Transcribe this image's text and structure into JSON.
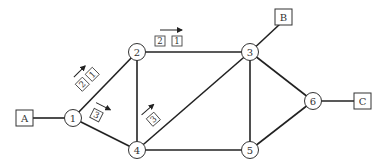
{
  "diagram": {
    "type": "network-graph",
    "routers": [
      {
        "id": "1",
        "label": "1"
      },
      {
        "id": "2",
        "label": "2"
      },
      {
        "id": "3",
        "label": "3"
      },
      {
        "id": "4",
        "label": "4"
      },
      {
        "id": "5",
        "label": "5"
      },
      {
        "id": "6",
        "label": "6"
      }
    ],
    "hosts": [
      {
        "id": "A",
        "label": "A",
        "attached_to": "1"
      },
      {
        "id": "B",
        "label": "B",
        "attached_to": "3"
      },
      {
        "id": "C",
        "label": "C",
        "attached_to": "6"
      }
    ],
    "links": [
      [
        "A",
        "1"
      ],
      [
        "1",
        "2"
      ],
      [
        "1",
        "4"
      ],
      [
        "2",
        "3"
      ],
      [
        "2",
        "4"
      ],
      [
        "4",
        "3"
      ],
      [
        "4",
        "5"
      ],
      [
        "3",
        "5"
      ],
      [
        "3",
        "6"
      ],
      [
        "5",
        "6"
      ],
      [
        "6",
        "C"
      ],
      [
        "3",
        "B"
      ]
    ],
    "packet_tags": {
      "link_1_2": [
        "2",
        "1"
      ],
      "link_2_3": [
        "2",
        "1"
      ],
      "link_1_4": [
        "3"
      ],
      "link_4_3": [
        "3"
      ]
    }
  }
}
